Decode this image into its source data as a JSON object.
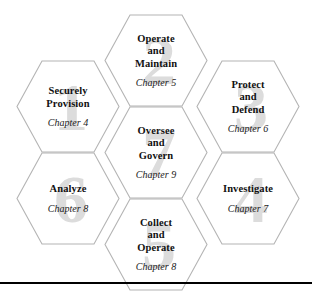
{
  "figure": {
    "type": "hexagon-framework-diagram",
    "stroke_color": "#b4b4b4",
    "watermark_color": "#dcdcdc",
    "text_color": "#111111",
    "rule_color": "#000000"
  },
  "hexagons": [
    {
      "number": "1",
      "title_lines": [
        "Securely",
        "Provision"
      ],
      "title": "Securely Provision",
      "chapter": "Chapter 4",
      "column": "left",
      "row": "upper"
    },
    {
      "number": "2",
      "title_lines": [
        "Operate",
        "and",
        "Maintain"
      ],
      "title": "Operate and Maintain",
      "chapter": "Chapter 5",
      "column": "mid",
      "row": "top"
    },
    {
      "number": "3",
      "title_lines": [
        "Protect",
        "and",
        "Defend"
      ],
      "title": "Protect and Defend",
      "chapter": "Chapter 6",
      "column": "right",
      "row": "upper"
    },
    {
      "number": "4",
      "title_lines": [
        "Investigate"
      ],
      "title": "Investigate",
      "chapter": "Chapter 7",
      "column": "right",
      "row": "lower"
    },
    {
      "number": "5",
      "title_lines": [
        "Collect",
        "and",
        "Operate"
      ],
      "title": "Collect and Operate",
      "chapter": "Chapter 8",
      "column": "mid",
      "row": "bottom"
    },
    {
      "number": "6",
      "title_lines": [
        "Analyze"
      ],
      "title": "Analyze",
      "chapter": "Chapter 8",
      "column": "left",
      "row": "lower"
    },
    {
      "number": "7",
      "title_lines": [
        "Oversee",
        "and",
        "Govern"
      ],
      "title": "Oversee and Govern",
      "chapter": "Chapter 9",
      "column": "mid",
      "row": "mid"
    }
  ]
}
